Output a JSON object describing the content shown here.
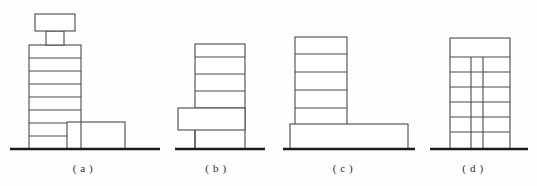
{
  "figure": {
    "kind": "architectural-massing-elevation-diagram",
    "panel_count": 4,
    "background_color": "#fefefe",
    "line_color": "#4a4a4a",
    "ground_line_color": "#1c1c1c",
    "fill_color": "#ffffff"
  },
  "captions": [
    {
      "text": "( a )",
      "x": 83,
      "y": 162
    },
    {
      "text": "( b )",
      "x": 216,
      "y": 162
    },
    {
      "text": "( c )",
      "x": 343,
      "y": 162
    },
    {
      "text": "( d )",
      "x": 473,
      "y": 162
    }
  ],
  "panels": [
    {
      "id": "panel-a",
      "label": "( a )",
      "ground": {
        "x1": 10,
        "x2": 160,
        "y": 149
      },
      "tower": {
        "x": 29,
        "y": 45,
        "width": 52,
        "height": 104,
        "floor_count": 8,
        "floor_lines_y": [
          58,
          71,
          84,
          97,
          110,
          123,
          136
        ]
      },
      "roof_neck": {
        "x": 46,
        "y": 31,
        "width": 18,
        "height": 14
      },
      "roof_cap": {
        "x": 35,
        "y": 14,
        "width": 40,
        "height": 17
      },
      "low_block": {
        "x": 67,
        "y": 122,
        "width": 58,
        "height": 27
      }
    },
    {
      "id": "panel-b",
      "label": "( b )",
      "ground": {
        "x1": 175,
        "x2": 265,
        "y": 149
      },
      "tower": {
        "x": 195,
        "y": 44,
        "width": 50,
        "height": 105,
        "floor_count": 5,
        "floor_lines_y": [
          57,
          74,
          91,
          108,
          125
        ]
      },
      "side_block": {
        "x": 178,
        "y": 108,
        "width": 67,
        "height": 22
      }
    },
    {
      "id": "panel-c",
      "label": "( c )",
      "ground": {
        "x1": 283,
        "x2": 415,
        "y": 149
      },
      "tower": {
        "x": 295,
        "y": 37,
        "width": 52,
        "height": 90,
        "floor_count": 5,
        "floor_lines_y": [
          54,
          72,
          90,
          108
        ]
      },
      "podium": {
        "x": 290,
        "y": 124,
        "width": 118,
        "height": 25
      }
    },
    {
      "id": "panel-d",
      "label": "( d )",
      "ground": {
        "x1": 430,
        "x2": 528,
        "y": 149
      },
      "tower": {
        "x": 450,
        "y": 38,
        "width": 60,
        "height": 111,
        "floor_count": 7,
        "floor_lines_y": [
          57,
          72,
          87,
          102,
          117,
          132
        ]
      },
      "core_lines_x": [
        471,
        483
      ],
      "core_top_y": 57
    }
  ]
}
